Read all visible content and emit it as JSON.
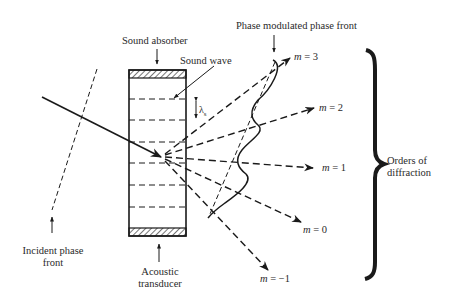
{
  "labels": {
    "sound_absorber": "Sound absorber",
    "sound_wave": "Sound wave",
    "phase_modulated_front": "Phase modulated phase front",
    "incident_front_line1": "Incident phase",
    "incident_front_line2": "front",
    "acoustic_line1": "Acoustic",
    "acoustic_line2": "transducer",
    "orders_line1": "Orders of",
    "orders_line2": "diffraction",
    "lambda": "λ",
    "lambda_sub": "s"
  },
  "orders": [
    {
      "m_symbol": "m",
      "value": "= 3"
    },
    {
      "m_symbol": "m",
      "value": "= 2"
    },
    {
      "m_symbol": "m",
      "value": "= 1"
    },
    {
      "m_symbol": "m",
      "value": "= 0"
    },
    {
      "m_symbol": "m",
      "value": "= −1"
    }
  ],
  "colors": {
    "ink": "#1a1a1a",
    "background": "#ffffff"
  }
}
